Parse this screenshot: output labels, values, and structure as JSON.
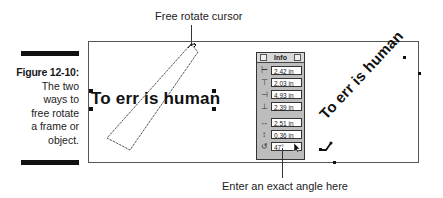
{
  "figure": {
    "number": "Figure 12-10:",
    "description": [
      "The two",
      "ways to",
      "free rotate",
      "a frame or",
      "object."
    ]
  },
  "callouts": {
    "top": "Free rotate cursor",
    "bottom": "Enter an exact angle here"
  },
  "canvas": {
    "left_text": "To err is human",
    "rotated_text": "To err is human"
  },
  "info_palette": {
    "title": "Info",
    "rows": [
      {
        "icon": "x-position-icon",
        "glyph": "⊢",
        "value": "2.42 in"
      },
      {
        "icon": "y-position-icon",
        "glyph": "⊤",
        "value": "2.03 in"
      },
      {
        "icon": "right-edge-icon",
        "glyph": "⊣",
        "value": "4.93 in"
      },
      {
        "icon": "bottom-edge-icon",
        "glyph": "⊥",
        "value": "2.39 in"
      },
      {
        "icon": "width-icon",
        "glyph": "↔",
        "value": "2.51 in"
      },
      {
        "icon": "height-icon",
        "glyph": "↕",
        "value": "0.36 in"
      },
      {
        "icon": "rotation-angle-icon",
        "glyph": "↺",
        "value": "47°"
      }
    ]
  }
}
